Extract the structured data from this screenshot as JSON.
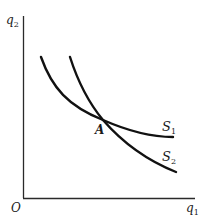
{
  "diagram": {
    "type": "indifference-curves",
    "axes": {
      "origin_label": "O",
      "x_label": {
        "main": "q",
        "sub": "1"
      },
      "y_label": {
        "main": "q",
        "sub": "2"
      }
    },
    "curves": [
      {
        "id": "S1",
        "label": {
          "main": "S",
          "sub": "1"
        }
      },
      {
        "id": "S2",
        "label": {
          "main": "S",
          "sub": "2"
        }
      }
    ],
    "intersection_label": "A",
    "colors": {
      "ink": "#1a1a1a",
      "background": "#ffffff"
    }
  }
}
